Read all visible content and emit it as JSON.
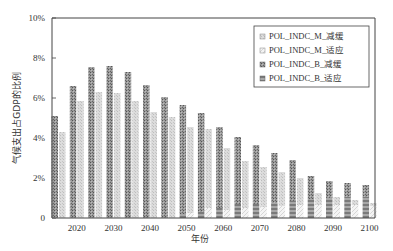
{
  "chart_data": {
    "type": "bar",
    "stacked": true,
    "title": "",
    "xlabel": "年份",
    "ylabel": "气候支出占GDP的比例",
    "ylim": [
      0,
      10
    ],
    "yticks": [
      "0",
      "2%",
      "4%",
      "6%",
      "8%",
      "10%"
    ],
    "xticks": [
      "2020",
      "2030",
      "2040",
      "2050",
      "2060",
      "2070",
      "2080",
      "2090",
      "2100"
    ],
    "grid": false,
    "legend_position": "upper right",
    "categories": [
      2015,
      2020,
      2025,
      2030,
      2035,
      2040,
      2045,
      2050,
      2055,
      2060,
      2065,
      2070,
      2075,
      2080,
      2085,
      2090,
      2095,
      2100
    ],
    "series": [
      {
        "name": "POL_INDC_M_减缓",
        "stack": "M",
        "values": [
          4.3,
          5.85,
          6.3,
          6.25,
          5.85,
          5.3,
          5.05,
          4.3,
          3.95,
          3.1,
          2.35,
          2.0,
          1.7,
          1.35,
          0.6,
          0.4,
          0.25,
          0.15
        ]
      },
      {
        "name": "POL_INDC_M_适应",
        "stack": "M",
        "values": [
          0.0,
          0.0,
          0.0,
          0.0,
          0.0,
          0.0,
          0.0,
          0.25,
          0.5,
          0.4,
          0.5,
          0.55,
          0.6,
          0.65,
          0.65,
          0.65,
          0.65,
          0.6
        ]
      },
      {
        "name": "POL_INDC_B_减缓",
        "stack": "B",
        "values": [
          5.1,
          6.6,
          7.55,
          7.6,
          7.3,
          6.65,
          6.05,
          5.45,
          4.95,
          4.05,
          3.35,
          2.95,
          2.5,
          2.05,
          1.15,
          0.85,
          0.7,
          0.6
        ]
      },
      {
        "name": "POL_INDC_B_适应",
        "stack": "B",
        "values": [
          0.0,
          0.0,
          0.0,
          0.0,
          0.0,
          0.0,
          0.0,
          0.2,
          0.3,
          0.5,
          0.7,
          0.7,
          0.75,
          0.85,
          0.95,
          1.0,
          1.05,
          1.05
        ]
      }
    ]
  },
  "legend": {
    "items": [
      {
        "label": "POL_INDC_M_减缓"
      },
      {
        "label": "POL_INDC_M_适应"
      },
      {
        "label": "POL_INDC_B_减缓"
      },
      {
        "label": "POL_INDC_B_适应"
      }
    ]
  },
  "colors": {
    "m_mitigation": "#d8d8d8",
    "m_adaptation": "#eeeeee",
    "b_mitigation": "#8a8a8a",
    "b_adaptation": "#6e6e6e",
    "axis": "#333333"
  }
}
